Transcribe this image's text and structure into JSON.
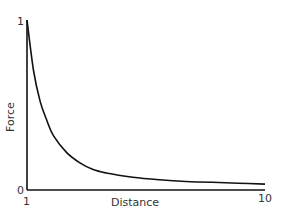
{
  "chart_data": {
    "type": "line",
    "title": "",
    "xlabel": "Distance",
    "ylabel": "Force",
    "xlim": [
      1,
      10
    ],
    "ylim": [
      0,
      1
    ],
    "x_ticks": [
      "1",
      "10"
    ],
    "y_ticks": [
      "0",
      "1"
    ],
    "grid": false,
    "legend": null,
    "series": [
      {
        "name": "Force vs Distance",
        "color": "#111111",
        "x": [
          1,
          1.25,
          1.5,
          1.75,
          2,
          2.5,
          3,
          3.5,
          4,
          5,
          6,
          7,
          8,
          9,
          10
        ],
        "y": [
          1.0,
          0.7,
          0.52,
          0.41,
          0.32,
          0.22,
          0.16,
          0.12,
          0.1,
          0.075,
          0.06,
          0.05,
          0.045,
          0.04,
          0.035
        ]
      }
    ]
  }
}
